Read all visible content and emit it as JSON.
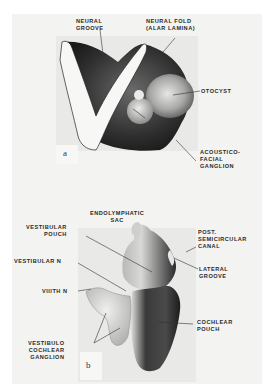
{
  "figure": {
    "panel_a": {
      "letter": "a",
      "labels": {
        "neural_groove": "NEURAL\nGROOVE",
        "neural_fold": "NEURAL FOLD\n(ALAR LAMINA)",
        "otocyst": "OTOCYST",
        "acoustico_facial": "ACOUSTICO-\nFACIAL\nGANGLION"
      }
    },
    "panel_b": {
      "letter": "b",
      "labels": {
        "endolymphatic_sac": "ENDOLYMPHATIC\nSAC",
        "vestibular_pouch": "VESTIBULAR\nPOUCH",
        "vestibular_n": "VESTIBULAR N",
        "viiith_n": "VIIITH N",
        "vestibulo_cochlear": "VESTIBULO\nCOCHLEAR\nGANGLION",
        "post_semicircular": "POST.\nSEMICIRCULAR\nCANAL",
        "lateral_groove": "LATERAL\nGROOVE",
        "cochlear_pouch": "COCHLEAR\nPOUCH"
      }
    }
  }
}
